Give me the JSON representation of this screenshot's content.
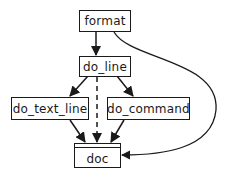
{
  "diagram": {
    "type": "call-graph",
    "nodes": [
      {
        "id": "format",
        "label": "format"
      },
      {
        "id": "do_line",
        "label": "do_line"
      },
      {
        "id": "do_text_line",
        "label": "do_text_line"
      },
      {
        "id": "do_command",
        "label": "do_command"
      },
      {
        "id": "doc",
        "label": "doc",
        "style": "data-store"
      }
    ],
    "edges": [
      {
        "from": "format",
        "to": "do_line",
        "style": "solid"
      },
      {
        "from": "format",
        "to": "doc",
        "style": "solid-curve"
      },
      {
        "from": "do_line",
        "to": "do_text_line",
        "style": "solid"
      },
      {
        "from": "do_line",
        "to": "do_command",
        "style": "solid"
      },
      {
        "from": "do_line",
        "to": "doc",
        "style": "dashed"
      },
      {
        "from": "do_text_line",
        "to": "doc",
        "style": "solid"
      },
      {
        "from": "do_command",
        "to": "doc",
        "style": "solid"
      }
    ],
    "colors": {
      "stroke": "#1a1a1a",
      "background": "#ffffff"
    }
  }
}
